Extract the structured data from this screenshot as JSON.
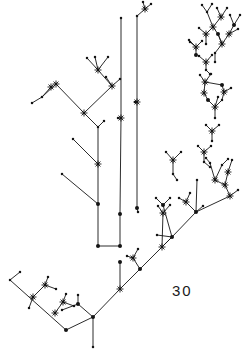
{
  "figure": {
    "kind": "phylogenetic-tree-diagram",
    "label": "30",
    "background_color": "#ffffff",
    "ink_color": "#141414",
    "width": 242,
    "height": 352,
    "node_styles": {
      "small_dot": "plain terminal / internal node",
      "large_dot": "emphasized node",
      "star": "starburst node marker"
    },
    "edges": [
      [
        93,
        317,
        93,
        347
      ],
      [
        93,
        317,
        120,
        289
      ],
      [
        120,
        289,
        120,
        262
      ],
      [
        93,
        317,
        78,
        304
      ],
      [
        78,
        304,
        78,
        295
      ],
      [
        78,
        304,
        62,
        310
      ],
      [
        93,
        317,
        66,
        330
      ],
      [
        66,
        330,
        10,
        280
      ],
      [
        10,
        280,
        20,
        272
      ],
      [
        33,
        297,
        45,
        285
      ],
      [
        45,
        285,
        48,
        277
      ],
      [
        45,
        285,
        56,
        289
      ],
      [
        33,
        297,
        29,
        308
      ],
      [
        55,
        313,
        63,
        302
      ],
      [
        63,
        302,
        66,
        294
      ],
      [
        63,
        302,
        74,
        306
      ],
      [
        120,
        289,
        162,
        247
      ],
      [
        162,
        247,
        172,
        237
      ],
      [
        140,
        269,
        133,
        258
      ],
      [
        133,
        258,
        127,
        256
      ],
      [
        133,
        258,
        138,
        249
      ],
      [
        120,
        246,
        98,
        246
      ],
      [
        98,
        246,
        98,
        204
      ],
      [
        98,
        204,
        62,
        174
      ],
      [
        98,
        204,
        98,
        164
      ],
      [
        98,
        164,
        73,
        139
      ],
      [
        98,
        164,
        98,
        127
      ],
      [
        98,
        127,
        104,
        121
      ],
      [
        98,
        127,
        84,
        113
      ],
      [
        84,
        113,
        56,
        84
      ],
      [
        56,
        84,
        42,
        97
      ],
      [
        42,
        97,
        32,
        103
      ],
      [
        42,
        97,
        51,
        87
      ],
      [
        84,
        113,
        112,
        86
      ],
      [
        112,
        86,
        106,
        77
      ],
      [
        112,
        86,
        120,
        79
      ],
      [
        112,
        86,
        98,
        70
      ],
      [
        98,
        70,
        87,
        58
      ],
      [
        98,
        70,
        95,
        57
      ],
      [
        98,
        70,
        108,
        57
      ],
      [
        162,
        247,
        172,
        237
      ],
      [
        172,
        237,
        163,
        205
      ],
      [
        163,
        205,
        156,
        198
      ],
      [
        163,
        205,
        170,
        198
      ],
      [
        172,
        237,
        196,
        212
      ],
      [
        196,
        212,
        186,
        202
      ],
      [
        186,
        202,
        179,
        198
      ],
      [
        186,
        202,
        190,
        193
      ],
      [
        196,
        212,
        230,
        196
      ],
      [
        230,
        196,
        238,
        190
      ],
      [
        230,
        196,
        225,
        185
      ],
      [
        225,
        185,
        215,
        180
      ],
      [
        215,
        180,
        210,
        163
      ],
      [
        210,
        163,
        206,
        158
      ],
      [
        215,
        180,
        222,
        165
      ],
      [
        222,
        165,
        228,
        159
      ],
      [
        225,
        185,
        228,
        172
      ],
      [
        228,
        172,
        232,
        160
      ],
      [
        196,
        212,
        197,
        180
      ],
      [
        172,
        237,
        157,
        235
      ],
      [
        162,
        247,
        163,
        213
      ],
      [
        163,
        213,
        158,
        206
      ],
      [
        163,
        213,
        170,
        205
      ],
      [
        120,
        246,
        120,
        214
      ],
      [
        120,
        214,
        121,
        118
      ],
      [
        121,
        118,
        121,
        18
      ],
      [
        121,
        118,
        118,
        118
      ],
      [
        137,
        208,
        137,
        102
      ],
      [
        137,
        102,
        137,
        16
      ],
      [
        137,
        102,
        135,
        102
      ],
      [
        137,
        208,
        138,
        212
      ],
      [
        137,
        16,
        145,
        9
      ],
      [
        145,
        9,
        151,
        4
      ],
      [
        145,
        9,
        143,
        2
      ],
      [
        162,
        247,
        172,
        237
      ],
      [
        173,
        174,
        173,
        160
      ],
      [
        173,
        160,
        166,
        152
      ],
      [
        173,
        160,
        181,
        152
      ],
      [
        173,
        174,
        177,
        180
      ],
      [
        196,
        212,
        203,
        206
      ],
      [
        204,
        162,
        204,
        152
      ],
      [
        204,
        152,
        198,
        146
      ],
      [
        204,
        152,
        211,
        146
      ],
      [
        204,
        162,
        210,
        167
      ],
      [
        212,
        141,
        212,
        131
      ],
      [
        212,
        131,
        206,
        125
      ],
      [
        212,
        131,
        219,
        125
      ],
      [
        215,
        118,
        215,
        107
      ],
      [
        215,
        107,
        208,
        100
      ],
      [
        208,
        100,
        204,
        93
      ],
      [
        204,
        93,
        205,
        82
      ],
      [
        205,
        82,
        200,
        75
      ],
      [
        205,
        82,
        211,
        74
      ],
      [
        215,
        107,
        222,
        100
      ],
      [
        222,
        100,
        224,
        92
      ],
      [
        224,
        92,
        222,
        85
      ],
      [
        222,
        85,
        205,
        82
      ],
      [
        224,
        92,
        231,
        88
      ],
      [
        215,
        107,
        218,
        97
      ],
      [
        206,
        70,
        206,
        62
      ],
      [
        206,
        62,
        199,
        56
      ],
      [
        206,
        62,
        212,
        55
      ],
      [
        206,
        70,
        210,
        74
      ],
      [
        196,
        55,
        196,
        47
      ],
      [
        196,
        47,
        190,
        42
      ],
      [
        196,
        47,
        202,
        41
      ],
      [
        206,
        44,
        206,
        34
      ],
      [
        206,
        34,
        199,
        28
      ],
      [
        206,
        34,
        213,
        27
      ],
      [
        222,
        44,
        218,
        34
      ],
      [
        218,
        34,
        213,
        27
      ],
      [
        213,
        27,
        207,
        12
      ],
      [
        207,
        12,
        202,
        5
      ],
      [
        207,
        12,
        212,
        4
      ],
      [
        213,
        27,
        221,
        17
      ],
      [
        221,
        17,
        217,
        8
      ],
      [
        221,
        17,
        227,
        8
      ],
      [
        222,
        44,
        229,
        34
      ],
      [
        229,
        34,
        234,
        25
      ],
      [
        234,
        25,
        230,
        15
      ],
      [
        234,
        25,
        240,
        15
      ],
      [
        229,
        34,
        238,
        29
      ],
      [
        218,
        34,
        222,
        44
      ],
      [
        222,
        44,
        215,
        53
      ],
      [
        215,
        53,
        215,
        62
      ],
      [
        196,
        47,
        189,
        40
      ]
    ]
  }
}
